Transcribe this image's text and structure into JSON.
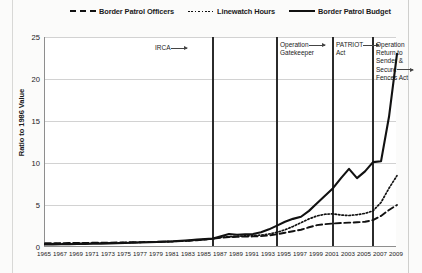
{
  "chart_data": {
    "type": "line",
    "title": "",
    "xlabel": "",
    "ylabel": "Ratio to 1986 Value",
    "xlim": [
      1965,
      2009
    ],
    "ylim": [
      0,
      25
    ],
    "yticks": [
      0,
      5,
      10,
      15,
      20,
      25
    ],
    "grid": true,
    "legend_position": "top",
    "x": [
      1965,
      1966,
      1967,
      1968,
      1969,
      1970,
      1971,
      1972,
      1973,
      1974,
      1975,
      1976,
      1977,
      1978,
      1979,
      1980,
      1981,
      1982,
      1983,
      1984,
      1985,
      1986,
      1987,
      1988,
      1989,
      1990,
      1991,
      1992,
      1993,
      1994,
      1995,
      1996,
      1997,
      1998,
      1999,
      2000,
      2001,
      2002,
      2003,
      2004,
      2005,
      2006,
      2007,
      2008,
      2009
    ],
    "xtick_labels": [
      "1965",
      "1967",
      "1969",
      "1971",
      "1973",
      "1975",
      "1977",
      "1979",
      "1981",
      "1983",
      "1985",
      "1987",
      "1989",
      "1991",
      "1993",
      "1995",
      "1997",
      "1999",
      "2001",
      "2003",
      "2005",
      "2007",
      "2009"
    ],
    "series": [
      {
        "name": "Border Patrol Officers",
        "style": "dashed",
        "color": "#111111",
        "values": [
          0.45,
          0.46,
          0.46,
          0.47,
          0.48,
          0.49,
          0.5,
          0.51,
          0.52,
          0.54,
          0.55,
          0.57,
          0.58,
          0.6,
          0.62,
          0.64,
          0.66,
          0.7,
          0.74,
          0.8,
          0.88,
          1.0,
          1.12,
          1.18,
          1.22,
          1.24,
          1.26,
          1.3,
          1.38,
          1.52,
          1.7,
          1.88,
          2.05,
          2.35,
          2.6,
          2.72,
          2.8,
          2.86,
          2.9,
          2.94,
          3.0,
          3.2,
          3.7,
          4.4,
          5.0
        ]
      },
      {
        "name": "Linewatch Hours",
        "style": "dotted",
        "color": "#111111",
        "values": [
          0.38,
          0.39,
          0.4,
          0.41,
          0.42,
          0.43,
          0.45,
          0.46,
          0.48,
          0.5,
          0.52,
          0.54,
          0.56,
          0.58,
          0.6,
          0.63,
          0.66,
          0.7,
          0.75,
          0.82,
          0.9,
          1.0,
          1.14,
          1.22,
          1.28,
          1.32,
          1.36,
          1.42,
          1.55,
          1.75,
          2.05,
          2.45,
          2.9,
          3.35,
          3.7,
          3.9,
          3.95,
          3.8,
          3.75,
          3.85,
          4.0,
          4.3,
          5.3,
          7.0,
          8.5
        ]
      },
      {
        "name": "Border Patrol Budget",
        "style": "solid",
        "color": "#111111",
        "values": [
          0.3,
          0.31,
          0.32,
          0.33,
          0.35,
          0.36,
          0.38,
          0.4,
          0.42,
          0.45,
          0.47,
          0.5,
          0.53,
          0.56,
          0.6,
          0.64,
          0.68,
          0.74,
          0.8,
          0.88,
          0.94,
          1.0,
          1.28,
          1.55,
          1.45,
          1.5,
          1.55,
          1.75,
          2.1,
          2.55,
          3.0,
          3.35,
          3.6,
          4.3,
          5.2,
          6.1,
          7.0,
          8.2,
          9.3,
          8.2,
          9.0,
          10.1,
          10.2,
          15.5,
          23.0
        ]
      }
    ],
    "annotations": [
      {
        "label": "IRCA",
        "year": 1986,
        "line": false,
        "lines": [
          "IRCA"
        ]
      },
      {
        "label": "Operation Gatekeeper",
        "year": 1994,
        "line": true,
        "lines": [
          "Operation",
          "Gatekeeper"
        ]
      },
      {
        "label": "PATRIOT Act",
        "year": 2001,
        "line": true,
        "lines": [
          "PATRIOT",
          "Act"
        ]
      },
      {
        "label": "Operation Return to Sender & Secure Fences Act",
        "year": 2006,
        "line": true,
        "lines": [
          "Operation",
          "Return to",
          "Sender &",
          "Secure",
          "Fences Act"
        ]
      }
    ],
    "event_lines_years": [
      1986,
      1994,
      2001,
      2006
    ]
  },
  "legend": {
    "items": [
      {
        "label": "Border Patrol Officers",
        "key": "dashed"
      },
      {
        "label": "Linewatch Hours",
        "key": "dotted"
      },
      {
        "label": "Border Patrol Budget",
        "key": "solid"
      }
    ]
  },
  "axis": {
    "y_title": "Ratio to 1986 Value",
    "y_tick_0": "0",
    "y_tick_1": "5",
    "y_tick_2": "10",
    "y_tick_3": "15",
    "y_tick_4": "20",
    "y_tick_5": "25"
  }
}
